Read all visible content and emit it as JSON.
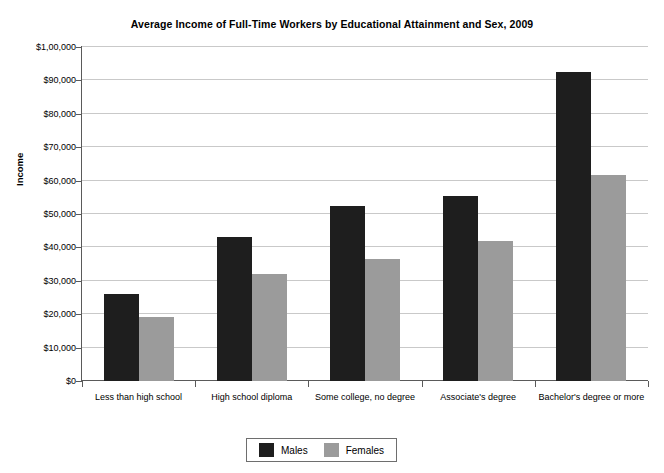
{
  "chart_data": {
    "type": "bar",
    "title": "Average Income of Full-Time Workers by Educational Attainment and Sex, 2009",
    "xlabel": "",
    "ylabel": "Income",
    "categories": [
      "Less than high school",
      "High school diploma",
      "Some college, no degree",
      "Associate's degree",
      "Bachelor's degree or more"
    ],
    "series": [
      {
        "name": "Males",
        "color": "#1e1e1e",
        "values": [
          26200,
          43000,
          52300,
          55500,
          92500
        ]
      },
      {
        "name": "Females",
        "color": "#9b9b9b",
        "values": [
          19300,
          32000,
          36500,
          42000,
          61700
        ]
      }
    ],
    "ylim": [
      0,
      100000
    ],
    "ytick_values": [
      0,
      10000,
      20000,
      30000,
      40000,
      50000,
      60000,
      70000,
      80000,
      90000,
      100000
    ],
    "ytick_labels": [
      "$0",
      "$10,000",
      "$20,000",
      "$30,000",
      "$40,000",
      "$50,000",
      "$60,000",
      "$70,000",
      "$80,000",
      "$90,000",
      "$1,00,000"
    ],
    "grid": true,
    "legend_position": "bottom-center",
    "background_color": "#ffffff",
    "gridline_color": "#c9c9c9",
    "axis_color": "#5a5a5a"
  }
}
